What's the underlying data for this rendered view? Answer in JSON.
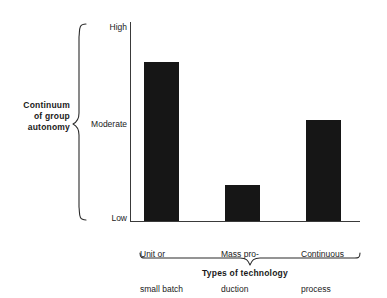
{
  "chart_data": {
    "type": "bar",
    "title": "",
    "categories": [
      "Unit or small batch",
      "Mass production",
      "Continuous process"
    ],
    "category_lines": [
      [
        "Unit or",
        "small batch"
      ],
      [
        "Mass pro-",
        "duction"
      ],
      [
        "Continuous",
        "process"
      ]
    ],
    "values": [
      0.8,
      0.18,
      0.51
    ],
    "value_labels": [
      "High-Moderate",
      "Low",
      "Moderate"
    ],
    "xlabel": "Types of technology",
    "ylabel": "Continuum of group autonomy",
    "ytick_labels": [
      "High",
      "Moderate",
      "Low"
    ],
    "ytick_values": [
      1.0,
      0.5,
      0.0
    ],
    "ylim": [
      0,
      1
    ],
    "grid": false,
    "legend": false,
    "bar_color": "#161616",
    "axis_color": "#3a3a3a",
    "background": "#ffffff"
  },
  "axis": {
    "y_title_lines": [
      "Continuum",
      "of group",
      "autonomy"
    ],
    "y_title": "Continuum of group autonomy",
    "x_title": "Types of technology",
    "ticks": {
      "high": "High",
      "moderate": "Moderate",
      "low": "Low"
    }
  },
  "categories": [
    {
      "line1": "Unit or",
      "line2": "small batch"
    },
    {
      "line1": "Mass pro-",
      "line2": "duction"
    },
    {
      "line1": "Continuous",
      "line2": "process"
    }
  ]
}
